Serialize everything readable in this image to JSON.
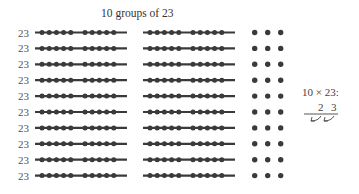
{
  "title": "10 groups of 23",
  "rows": 10,
  "row_label": "23",
  "annotation": {
    "expression": "10 × 23:",
    "digits": [
      "2",
      "3"
    ]
  },
  "colors": {
    "ink": "#333333",
    "line": "#3a3a3a"
  }
}
